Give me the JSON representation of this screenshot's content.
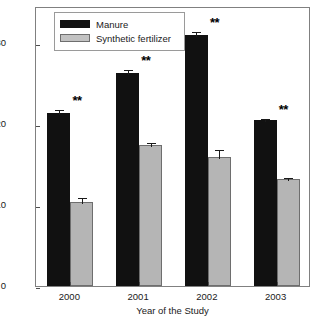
{
  "chart_data": {
    "type": "bar",
    "title": "",
    "xlabel": "Year of the Study",
    "ylabel": "Concentration (ppm dry weight)",
    "categories": [
      "2000",
      "2001",
      "2002",
      "2003"
    ],
    "ylim": [
      0,
      34.5
    ],
    "yticks": [
      0,
      10,
      20,
      30
    ],
    "ytick_labels": [
      "0",
      "10",
      "20",
      "30"
    ],
    "grid": false,
    "legend_position": "top-left",
    "series": [
      {
        "name": "Manure",
        "color": "#111111",
        "values": [
          21.3,
          26.3,
          30.9,
          20.4
        ],
        "errors": [
          0.6,
          0.6,
          0.7,
          0.4
        ]
      },
      {
        "name": "Synthetic fertilizer",
        "color": "#b5b5b5",
        "values": [
          10.4,
          17.4,
          15.9,
          13.2
        ],
        "errors": [
          0.7,
          0.5,
          1.1,
          0.4
        ]
      }
    ],
    "annotations": [
      {
        "label": "**",
        "category": "2000"
      },
      {
        "label": "**",
        "category": "2001"
      },
      {
        "label": "**",
        "category": "2002"
      },
      {
        "label": "**",
        "category": "2003"
      }
    ]
  },
  "legend": {
    "items": [
      {
        "label": "Manure"
      },
      {
        "label": "Synthetic fertilizer"
      }
    ]
  },
  "axes": {
    "y_title": "Concentration (ppm dry weight)",
    "x_title": "Year of the Study",
    "y_tick_0": "0",
    "y_tick_1": "10",
    "y_tick_2": "20",
    "y_tick_3": "30",
    "x_tick_0": "2000",
    "x_tick_1": "2001",
    "x_tick_2": "2002",
    "x_tick_3": "2003"
  },
  "significance": {
    "marker_2000": "**",
    "marker_2001": "**",
    "marker_2002": "**",
    "marker_2003": "**"
  }
}
